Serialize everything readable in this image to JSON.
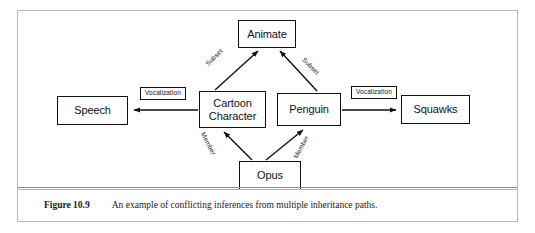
{
  "figure": {
    "caption_number": "Figure 10.9",
    "caption_text": "An example of conflicting inferences from multiple inheritance paths."
  },
  "diagram": {
    "type": "semantic-network",
    "nodes": [
      {
        "id": "animate",
        "label": "Animate"
      },
      {
        "id": "speech",
        "label": "Speech"
      },
      {
        "id": "cartoon",
        "label": "Cartoon\nCharacter"
      },
      {
        "id": "penguin",
        "label": "Penguin"
      },
      {
        "id": "squawks",
        "label": "Squawks"
      },
      {
        "id": "opus",
        "label": "Opus"
      }
    ],
    "edges": [
      {
        "from": "cartoon",
        "to": "animate",
        "label": "Subset",
        "style": "plain"
      },
      {
        "from": "penguin",
        "to": "animate",
        "label": "Subset",
        "style": "plain"
      },
      {
        "from": "cartoon",
        "to": "speech",
        "label": "Vocalization",
        "style": "boxed"
      },
      {
        "from": "penguin",
        "to": "squawks",
        "label": "Vocalization",
        "style": "boxed"
      },
      {
        "from": "opus",
        "to": "cartoon",
        "label": "Member",
        "style": "plain"
      },
      {
        "from": "opus",
        "to": "penguin",
        "label": "Member",
        "style": "plain"
      }
    ]
  },
  "colors": {
    "stroke": "#111111",
    "frame": "#b9b9b9",
    "rule": "#8e8e8e",
    "background": "#ffffff"
  }
}
